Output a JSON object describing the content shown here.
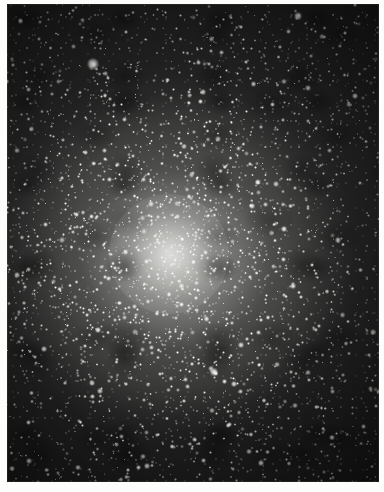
{
  "document": {
    "kind": "astronomical-photograph",
    "subject": "globular star cluster",
    "caption": ""
  },
  "image": {
    "alt_text": "Dense globular star cluster with a bright concentrated core",
    "width": 384,
    "height": 492,
    "background_color": "#ffffff",
    "sky_color": "#232323",
    "star_color": "#f5f5f0",
    "core_glow_color": "#ffffff",
    "margins": {
      "left": 7,
      "top": 4,
      "right": 5,
      "bottom": 10
    }
  },
  "chart_data": {
    "type": "scatter",
    "title": "",
    "xlabel": "",
    "ylabel": "",
    "core": {
      "x": 169,
      "y": 254,
      "radius": 60
    },
    "stars": [
      {
        "x": 93,
        "y": 64,
        "r": 6.0,
        "b": 1.0
      },
      {
        "x": 298,
        "y": 16,
        "r": 4.4,
        "b": 0.98
      },
      {
        "x": 355,
        "y": 96,
        "r": 3.2,
        "b": 0.92
      },
      {
        "x": 252,
        "y": 206,
        "r": 3.4,
        "b": 0.95
      },
      {
        "x": 214,
        "y": 372,
        "r": 3.6,
        "b": 0.96
      },
      {
        "x": 92,
        "y": 383,
        "r": 3.0,
        "b": 0.9
      },
      {
        "x": 44,
        "y": 349,
        "r": 3.0,
        "b": 0.9
      },
      {
        "x": 29,
        "y": 461,
        "r": 2.8,
        "b": 0.88
      },
      {
        "x": 261,
        "y": 463,
        "r": 2.6,
        "b": 0.86
      },
      {
        "x": 338,
        "y": 240,
        "r": 2.6,
        "b": 0.86
      },
      {
        "x": 360,
        "y": 183,
        "r": 2.4,
        "b": 0.84
      },
      {
        "x": 23,
        "y": 213,
        "r": 2.4,
        "b": 0.84
      },
      {
        "x": 133,
        "y": 156,
        "r": 2.4,
        "b": 0.84
      },
      {
        "x": 203,
        "y": 92,
        "r": 2.6,
        "b": 0.86
      },
      {
        "x": 316,
        "y": 330,
        "r": 2.4,
        "b": 0.84
      },
      {
        "x": 147,
        "y": 466,
        "r": 2.6,
        "b": 0.86
      },
      {
        "x": 63,
        "y": 140,
        "r": 2.2,
        "b": 0.8
      },
      {
        "x": 283,
        "y": 120,
        "r": 2.2,
        "b": 0.8
      },
      {
        "x": 176,
        "y": 318,
        "r": 2.2,
        "b": 0.8
      },
      {
        "x": 120,
        "y": 272,
        "r": 2.2,
        "b": 0.8
      }
    ]
  }
}
